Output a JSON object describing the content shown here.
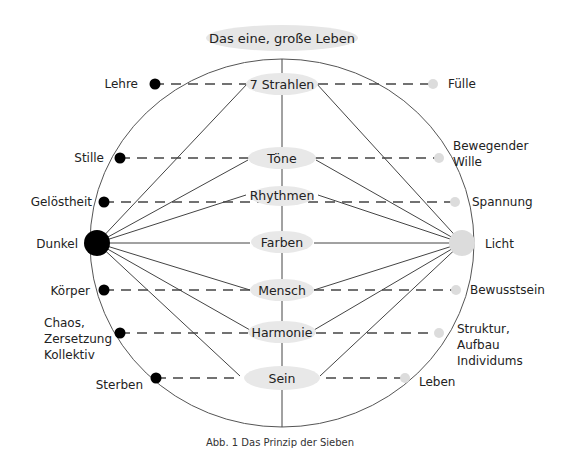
{
  "title": "Das eine, große Leben",
  "caption": "Abb. 1 Das Prinzip der Sieben",
  "poles": {
    "left": {
      "label": "Dunkel",
      "color": "#000000"
    },
    "right": {
      "label": "Licht",
      "color": "#e0e0e0"
    }
  },
  "center_nodes": [
    "7 Strahlen",
    "Töne",
    "Rhythmen",
    "Farben",
    "Mensch",
    "Harmonie",
    "Sein"
  ],
  "left_labels": [
    [
      "Lehre"
    ],
    [
      "Stille"
    ],
    [
      "Gelöstheit"
    ],
    [
      "Dunkel"
    ],
    [
      "Körper"
    ],
    [
      "Chaos,",
      "Zersetzung",
      "Kollektiv"
    ],
    [
      "Sterben"
    ]
  ],
  "right_labels": [
    [
      "Fülle"
    ],
    [
      "Bewegender",
      "Wille"
    ],
    [
      "Spannung"
    ],
    [
      "Licht"
    ],
    [
      "Bewusstsein"
    ],
    [
      "Struktur,",
      "Aufbau",
      "Individums"
    ],
    [
      "Leben"
    ]
  ]
}
